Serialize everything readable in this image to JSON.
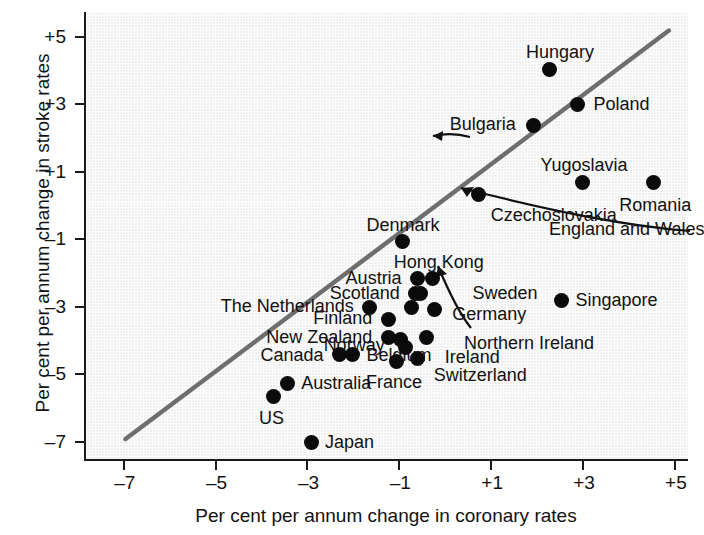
{
  "chart_data": {
    "type": "scatter",
    "title": "",
    "xlabel": "Per cent per annum change in coronary rates",
    "ylabel": "Per cent per annum change in stroke rates",
    "xlim": [
      -7.8,
      5.35
    ],
    "ylim": [
      -7.6,
      5.7
    ],
    "xticks": [
      "–7",
      "–5",
      "–3",
      "–1",
      "+1",
      "+3",
      "+5"
    ],
    "xtick_values": [
      -7,
      -5,
      -3,
      -1,
      1,
      3,
      5
    ],
    "yticks": [
      "+5",
      "+3",
      "+1",
      "–1",
      "–3",
      "–5",
      "–7"
    ],
    "ytick_values": [
      5,
      3,
      1,
      -1,
      -3,
      -5,
      -7
    ],
    "grid": true,
    "legend": "none",
    "trendline": {
      "label": "line of equality",
      "x_start": -6.94,
      "y_start": -6.95,
      "x_end": 4.89,
      "y_end": 5.15,
      "color": "#6e6e6e"
    },
    "points": [
      {
        "name": "Hungary",
        "x": 2.3,
        "y": 4.0,
        "label_dx": 10,
        "label_dy": -26,
        "label_align": "center"
      },
      {
        "name": "Poland",
        "x": 2.9,
        "y": 2.95,
        "label_dx": 16,
        "label_dy": -10,
        "label_align": "left"
      },
      {
        "name": "Bulgaria",
        "x": 1.95,
        "y": 2.35,
        "label_dx": -16,
        "label_dy": -10,
        "label_align": "right"
      },
      {
        "name": "Yugoslavia",
        "x": 3.0,
        "y": 0.65,
        "label_dx": 2,
        "label_dy": -26,
        "label_align": "center"
      },
      {
        "name": "Romania",
        "x": 4.55,
        "y": 0.65,
        "label_dx": 2,
        "label_dy": 14,
        "label_align": "center"
      },
      {
        "name": "Czechoslovakia",
        "x": 0.75,
        "y": 0.3,
        "label_dx": 12,
        "label_dy": 12,
        "label_align": "left"
      },
      {
        "name": "Denmark",
        "x": -0.9,
        "y": -1.1,
        "label_dx": 0,
        "label_dy": -26,
        "label_align": "center"
      },
      {
        "name": "Hong Kong",
        "x": -0.25,
        "y": -2.2,
        "label_dx": 6,
        "label_dy": -26,
        "label_align": "center"
      },
      {
        "name": "Austria",
        "x": -0.58,
        "y": -2.2,
        "label_dx": -14,
        "label_dy": -10,
        "label_align": "right"
      },
      {
        "name": "Sweden",
        "x": -0.52,
        "y": -2.65,
        "label_dx": 52,
        "label_dy": -10,
        "label_align": "left"
      },
      {
        "name": "Scotland",
        "x": -0.62,
        "y": -2.65,
        "label_dx": -14,
        "label_dy": -10,
        "label_align": "right"
      },
      {
        "name": "The Netherlands",
        "x": -1.62,
        "y": -3.05,
        "label_dx": -14,
        "label_dy": -10,
        "label_align": "right"
      },
      {
        "name": "Germany",
        "x": -0.22,
        "y": -3.1,
        "label_dx": 18,
        "label_dy": -4,
        "label_align": "left"
      },
      {
        "name": "England and Wales",
        "x": -0.72,
        "y": -3.05,
        "label_dx": 0,
        "label_dy": 0,
        "label_align": "leader"
      },
      {
        "name": "Finland",
        "x": -1.22,
        "y": -3.4,
        "label_dx": -14,
        "label_dy": -10,
        "label_align": "right"
      },
      {
        "name": "New Zealand",
        "x": -1.22,
        "y": -3.95,
        "label_dx": -14,
        "label_dy": -10,
        "label_align": "right"
      },
      {
        "name": "Norway",
        "x": -0.95,
        "y": -4.0,
        "label_dx": -14,
        "label_dy": -3,
        "label_align": "right"
      },
      {
        "name": "Ireland",
        "x": -0.38,
        "y": -3.95,
        "label_dx": 18,
        "label_dy": 10,
        "label_align": "left"
      },
      {
        "name": "Canada",
        "x": -2.28,
        "y": -4.45,
        "label_dx": -14,
        "label_dy": -9,
        "label_align": "right"
      },
      {
        "name": "Belgium",
        "x": -2.0,
        "y": -4.45,
        "label_dx": 14,
        "label_dy": -9,
        "label_align": "left"
      },
      {
        "name": "France",
        "x": -1.05,
        "y": -4.65,
        "label_dx": -2,
        "label_dy": 12,
        "label_align": "center"
      },
      {
        "name": "Switzerland",
        "x": -0.58,
        "y": -4.55,
        "label_dx": 16,
        "label_dy": 8,
        "label_align": "left"
      },
      {
        "name": "Northern Ireland",
        "x": -0.85,
        "y": -4.25,
        "label_dx": 0,
        "label_dy": 0,
        "label_align": "leader"
      },
      {
        "name": "Singapore",
        "x": 2.55,
        "y": -2.85,
        "label_dx": 14,
        "label_dy": -10,
        "label_align": "left"
      },
      {
        "name": "Australia",
        "x": -3.42,
        "y": -5.3,
        "label_dx": 14,
        "label_dy": -9,
        "label_align": "left"
      },
      {
        "name": "US",
        "x": -3.72,
        "y": -5.7,
        "label_dx": -2,
        "label_dy": 12,
        "label_align": "center"
      },
      {
        "name": "Japan",
        "x": -2.9,
        "y": -7.05,
        "label_dx": 14,
        "label_dy": -9,
        "label_align": "left"
      }
    ]
  },
  "axes": {
    "x_title": "Per cent per annum change in coronary rates",
    "y_title": "Per cent per annum change in stroke rates"
  }
}
